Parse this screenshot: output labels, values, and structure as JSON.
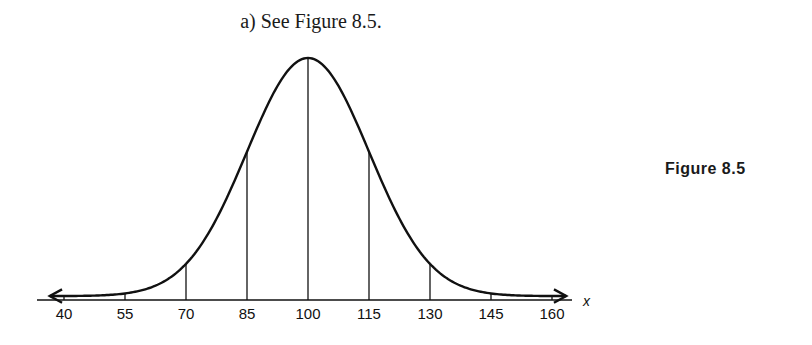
{
  "header": {
    "caption": "a)  See Figure 8.5."
  },
  "figure": {
    "label": "Figure 8.5"
  },
  "chart_data": {
    "type": "line",
    "title": "",
    "xlabel": "x",
    "ylabel": "",
    "x_ticks": [
      40,
      55,
      70,
      85,
      100,
      115,
      130,
      145,
      160
    ],
    "tick_labels": [
      "40",
      "55",
      "70",
      "85",
      "100",
      "115",
      "130",
      "145",
      "160"
    ],
    "mean": 100,
    "std_dev": 15,
    "xlim": [
      37,
      163
    ],
    "grid": false,
    "legend": null,
    "vertical_lines_at": [
      40,
      55,
      70,
      85,
      100,
      115,
      130,
      145,
      160
    ],
    "arrows_both_ends": true
  }
}
